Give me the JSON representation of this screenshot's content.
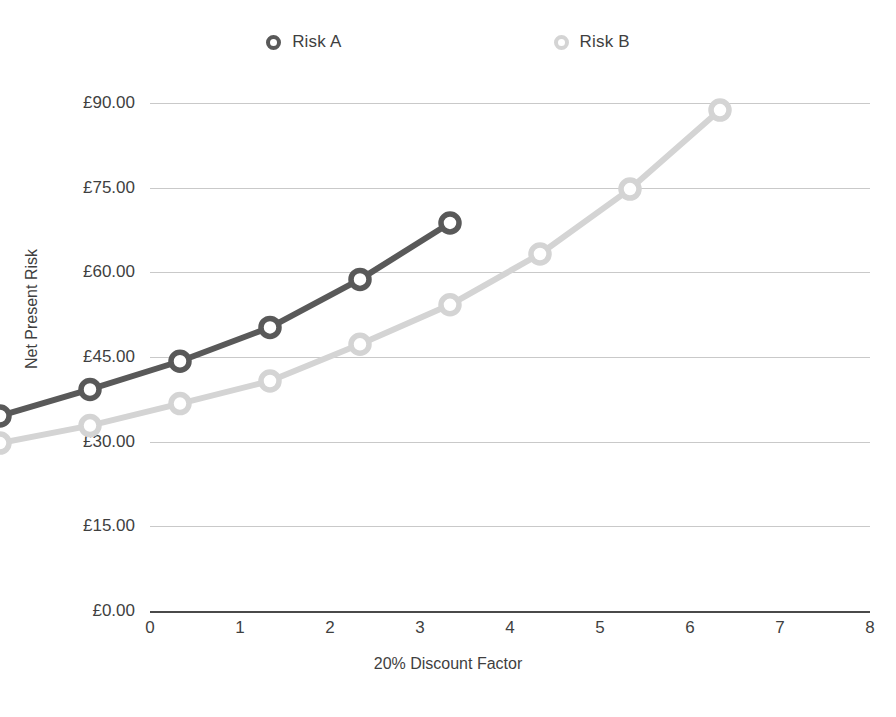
{
  "chart_data": {
    "type": "line",
    "title": "",
    "xlabel": "20% Discount Factor",
    "ylabel": "Net Present Risk",
    "x": [
      0,
      1,
      2,
      3,
      4,
      5,
      6,
      7,
      8
    ],
    "xtick_labels": [
      "0",
      "1",
      "2",
      "3",
      "4",
      "5",
      "6",
      "7",
      "8"
    ],
    "ytick_values": [
      0,
      15,
      30,
      45,
      60,
      75,
      90
    ],
    "ytick_labels": [
      "£0.00",
      "£15.00",
      "£30.00",
      "£45.00",
      "£60.00",
      "£75.00",
      "£90.00"
    ],
    "xlim": [
      0,
      8
    ],
    "ylim": [
      0,
      90
    ],
    "grid": "horizontal",
    "legend_position": "top",
    "series": [
      {
        "name": "Risk A",
        "color": "#595959",
        "x": [
          0,
          1,
          2,
          3,
          4,
          5
        ],
        "values": [
          16.3,
          21.0,
          26.0,
          32.0,
          40.5,
          50.5
        ]
      },
      {
        "name": "Risk B",
        "color": "#d4d4d4",
        "x": [
          0,
          1,
          2,
          3,
          4,
          5,
          6,
          7,
          8
        ],
        "values": [
          11.5,
          14.6,
          18.5,
          22.5,
          29.0,
          36.0,
          45.0,
          56.5,
          70.5
        ]
      }
    ]
  },
  "legend": {
    "items": [
      {
        "label": "Risk A",
        "marker": "circle-outline-dark-icon",
        "color": "#595959"
      },
      {
        "label": "Risk B",
        "marker": "circle-outline-light-icon",
        "color": "#d4d4d4"
      }
    ]
  },
  "axes": {
    "y_title": "Net Present Risk",
    "x_title": "20% Discount Factor",
    "zero_line_color": "#4a4a4a",
    "gridline_color": "#c9c9c9"
  }
}
